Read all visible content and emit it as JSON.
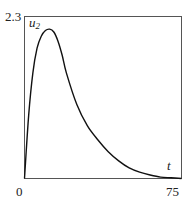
{
  "chart_data": {
    "type": "line",
    "title": "",
    "xlabel": "t",
    "ylabel": "u2",
    "ylabel_main": "u",
    "ylabel_sub": "2",
    "xlim": [
      0,
      75
    ],
    "ylim": [
      0,
      2.3
    ],
    "x_ticks": [
      "0",
      "75"
    ],
    "y_ticks": [
      "2.3"
    ],
    "grid": false,
    "legend": null,
    "series": [
      {
        "name": "u2",
        "x": [
          0,
          2,
          4,
          6,
          8,
          10,
          12,
          14,
          16,
          18,
          20,
          25,
          30,
          35,
          40,
          45,
          50,
          55,
          60,
          65,
          70,
          75
        ],
        "values": [
          0,
          0.9,
          1.5,
          1.85,
          2.02,
          2.1,
          2.12,
          2.08,
          1.95,
          1.75,
          1.5,
          1.05,
          0.75,
          0.55,
          0.38,
          0.25,
          0.15,
          0.09,
          0.05,
          0.02,
          0.01,
          0.0
        ]
      }
    ]
  }
}
